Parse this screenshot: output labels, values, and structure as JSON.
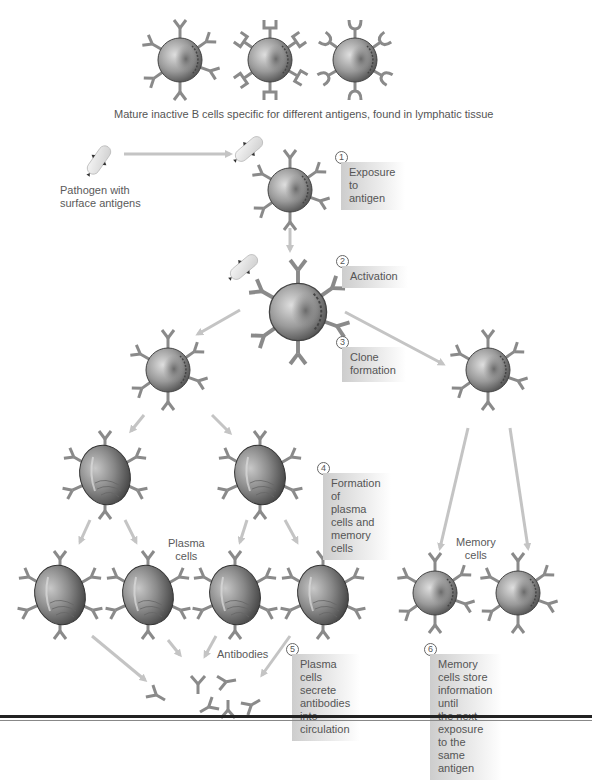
{
  "diagram": {
    "title_caption": "Mature inactive B cells specific for different antigens, found in lymphatic tissue",
    "pathogen_label": "Pathogen with\nsurface antigens",
    "plasma_cells_label": "Plasma\ncells",
    "memory_cells_label": "Memory\ncells",
    "antibodies_label": "Antibodies",
    "steps": [
      {
        "number": "1",
        "text": "Exposure to\nantigen"
      },
      {
        "number": "2",
        "text": "Activation"
      },
      {
        "number": "3",
        "text": "Clone\nformation"
      },
      {
        "number": "4",
        "text": "Formation of\nplasma cells and\nmemory cells"
      },
      {
        "number": "5",
        "text": "Plasma cells secrete\nantibodies into\ncirculation"
      },
      {
        "number": "6",
        "text": "Memory cells store\ninformation until\nthe next exposure\nto the same antigen"
      }
    ],
    "colors": {
      "receptor": "#8a8a8a",
      "arrow": "#c4c4c4",
      "cell_dark": "#555555",
      "cell_light": "#d8d8d8",
      "label_box": "#cdcdcd"
    }
  }
}
